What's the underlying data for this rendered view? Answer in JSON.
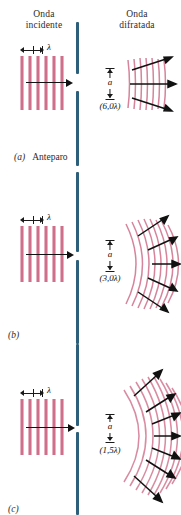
{
  "figure": {
    "title_incident": "Onda\nincidente",
    "title_diffracted": "Onda\ndifratada",
    "headers": {
      "incident_line1": "Onda",
      "incident_line2": "incidente",
      "diffracted_line1": "Onda",
      "diffracted_line2": "difratada"
    },
    "colors": {
      "wave_pink": "#cf6f8a",
      "barrier_blue": "#2e5f7a",
      "arrow_black": "#111111",
      "background": "#ffffff",
      "text": "#2b2b2b"
    },
    "wavelength_symbol": "λ",
    "slit_width_symbol": "a"
  },
  "panels": [
    {
      "id": "a",
      "label": "(a)",
      "caption_text": "Anteparo",
      "lambda_label": "λ",
      "slit_symbol": "a",
      "slit_width_label": "(6,0λ)",
      "slit_width_multiple": 6.0,
      "incident_stripe_count": 6,
      "diffracted_arc_count": 7,
      "diffracted_arrow_count": 3,
      "spread_degrees": 20,
      "curvature": "slight"
    },
    {
      "id": "b",
      "label": "(b)",
      "caption_text": "",
      "lambda_label": "λ",
      "slit_symbol": "a",
      "slit_width_label": "(3,0λ)",
      "slit_width_multiple": 3.0,
      "incident_stripe_count": 6,
      "diffracted_arc_count": 8,
      "diffracted_arrow_count": 5,
      "spread_degrees": 45,
      "curvature": "moderate"
    },
    {
      "id": "c",
      "label": "(c)",
      "caption_text": "",
      "lambda_label": "λ",
      "slit_symbol": "a",
      "slit_width_label": "(1,5λ)",
      "slit_width_multiple": 1.5,
      "incident_stripe_count": 6,
      "diffracted_arc_count": 9,
      "diffracted_arrow_count": 7,
      "spread_degrees": 75,
      "curvature": "strong"
    }
  ]
}
